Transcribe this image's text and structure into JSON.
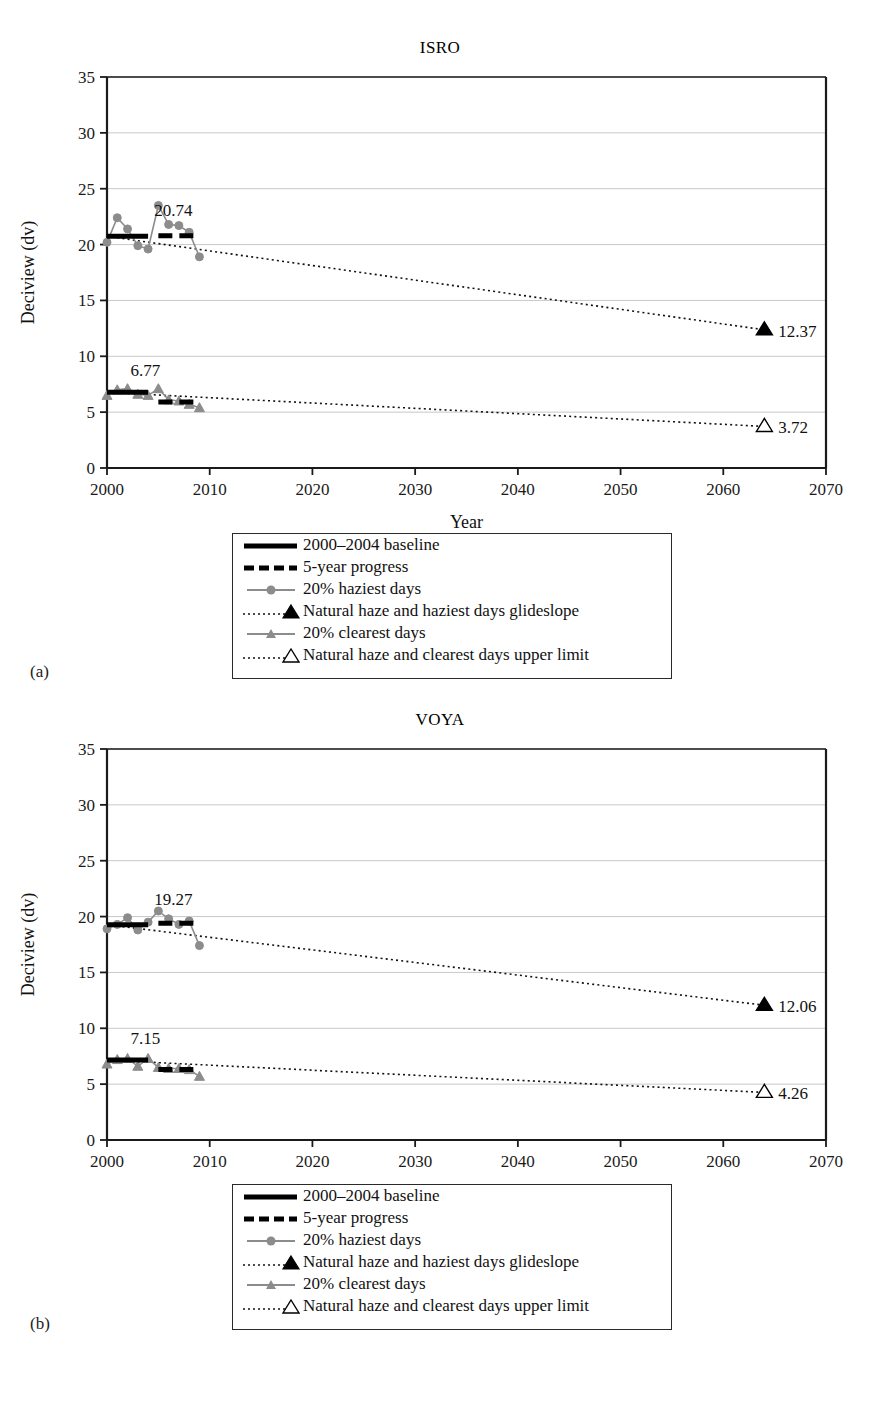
{
  "figure": {
    "panels": [
      {
        "sub_label": "(a)",
        "title": "ISRO",
        "xlabel": "Year",
        "ylabel": "Deciview (dv)",
        "baseline_haziest_label": "20.74",
        "baseline_clearest_label": "6.77",
        "endpoint_haziest_label": "12.37",
        "endpoint_clearest_label": "3.72"
      },
      {
        "sub_label": "(b)",
        "title": "VOYA",
        "xlabel": "Year",
        "ylabel": "Deciview (dv)",
        "baseline_haziest_label": "19.27",
        "baseline_clearest_label": "7.15",
        "endpoint_haziest_label": "12.06",
        "endpoint_clearest_label": "4.26"
      }
    ],
    "legend": {
      "items": [
        {
          "label": "2000–2004 baseline",
          "symbol": "solid-thick-black-line"
        },
        {
          "label": "5-year progress",
          "symbol": "dashed-thick-black-line"
        },
        {
          "label": "20% haziest days",
          "symbol": "gray-line-circle-marker"
        },
        {
          "label": "Natural haze and haziest days glideslope",
          "symbol": "dotted-line-filled-triangle"
        },
        {
          "label": "20% clearest days",
          "symbol": "gray-line-triangle-marker"
        },
        {
          "label": "Natural haze and clearest days upper limit",
          "symbol": "dotted-line-open-triangle"
        }
      ]
    },
    "colors": {
      "series_gray": "#8c8c8c",
      "baseline_black": "#000000",
      "axis_black": "#1a1a1a",
      "gridline_gray": "#c8c8c8",
      "background": "#ffffff"
    }
  },
  "chart_data": [
    {
      "type": "line",
      "title": "ISRO",
      "xlabel": "Year",
      "ylabel": "Deciview (dv)",
      "xlim": [
        2000,
        2070
      ],
      "ylim": [
        0,
        35
      ],
      "xticks": [
        2000,
        2010,
        2020,
        2030,
        2040,
        2050,
        2060,
        2070
      ],
      "yticks": [
        0,
        5,
        10,
        15,
        20,
        25,
        30,
        35
      ],
      "grid": true,
      "legend_position": "below-plot",
      "series": [
        {
          "name": "20% haziest days",
          "marker": "circle",
          "color": "#8c8c8c",
          "x": [
            2000,
            2001,
            2002,
            2003,
            2004,
            2005,
            2006,
            2007,
            2008,
            2009
          ],
          "values": [
            20.2,
            22.4,
            21.4,
            19.9,
            19.6,
            23.5,
            21.8,
            21.7,
            21.1,
            18.9
          ]
        },
        {
          "name": "20% clearest days",
          "marker": "triangle",
          "color": "#8c8c8c",
          "x": [
            2000,
            2001,
            2002,
            2003,
            2004,
            2005,
            2006,
            2007,
            2008,
            2009
          ],
          "values": [
            6.5,
            7.0,
            7.1,
            6.6,
            6.5,
            7.1,
            6.1,
            6.0,
            5.7,
            5.4
          ]
        },
        {
          "name": "2000–2004 baseline",
          "style": "solid-thick-black",
          "x": [
            2000,
            2004
          ],
          "value": 20.74
        },
        {
          "name": "2000–2004 baseline (clearest)",
          "style": "solid-thick-black",
          "x": [
            2000,
            2004
          ],
          "value": 6.77
        },
        {
          "name": "5-year progress (haziest)",
          "style": "dashed-thick-black",
          "x": [
            2005,
            2009
          ],
          "value": 20.8
        },
        {
          "name": "5-year progress (clearest)",
          "style": "dashed-thick-black",
          "x": [
            2005,
            2009
          ],
          "value": 5.9
        },
        {
          "name": "Natural haze and haziest days glideslope",
          "style": "dotted",
          "marker_end": "filled-triangle",
          "x": [
            2000,
            2064
          ],
          "values": [
            20.74,
            12.37
          ]
        },
        {
          "name": "Natural haze and clearest days upper limit",
          "style": "dotted",
          "marker_end": "open-triangle",
          "x": [
            2000,
            2064
          ],
          "values": [
            6.77,
            3.72
          ]
        }
      ]
    },
    {
      "type": "line",
      "title": "VOYA",
      "xlabel": "Year",
      "ylabel": "Deciview (dv)",
      "xlim": [
        2000,
        2070
      ],
      "ylim": [
        0,
        35
      ],
      "xticks": [
        2000,
        2010,
        2020,
        2030,
        2040,
        2050,
        2060,
        2070
      ],
      "yticks": [
        0,
        5,
        10,
        15,
        20,
        25,
        30,
        35
      ],
      "grid": true,
      "legend_position": "below-plot",
      "series": [
        {
          "name": "20% haziest days",
          "marker": "circle",
          "color": "#8c8c8c",
          "x": [
            2000,
            2001,
            2002,
            2003,
            2004,
            2005,
            2006,
            2007,
            2008,
            2009
          ],
          "values": [
            18.9,
            19.3,
            19.9,
            18.8,
            19.5,
            20.5,
            19.8,
            19.3,
            19.6,
            17.4
          ]
        },
        {
          "name": "20% clearest days",
          "marker": "triangle",
          "color": "#8c8c8c",
          "x": [
            2000,
            2001,
            2002,
            2003,
            2004,
            2005,
            2006,
            2007,
            2008,
            2009
          ],
          "values": [
            6.8,
            7.2,
            7.3,
            6.6,
            7.3,
            6.5,
            6.4,
            6.4,
            6.3,
            5.7
          ]
        },
        {
          "name": "2000–2004 baseline",
          "style": "solid-thick-black",
          "x": [
            2000,
            2004
          ],
          "value": 19.27
        },
        {
          "name": "2000–2004 baseline (clearest)",
          "style": "solid-thick-black",
          "x": [
            2000,
            2004
          ],
          "value": 7.15
        },
        {
          "name": "5-year progress (haziest)",
          "style": "dashed-thick-black",
          "x": [
            2005,
            2009
          ],
          "value": 19.4
        },
        {
          "name": "5-year progress (clearest)",
          "style": "dashed-thick-black",
          "x": [
            2005,
            2009
          ],
          "value": 6.3
        },
        {
          "name": "Natural haze and haziest days glideslope",
          "style": "dotted",
          "marker_end": "filled-triangle",
          "x": [
            2000,
            2064
          ],
          "values": [
            19.27,
            12.06
          ]
        },
        {
          "name": "Natural haze and clearest days upper limit",
          "style": "dotted",
          "marker_end": "open-triangle",
          "x": [
            2000,
            2064
          ],
          "values": [
            7.15,
            4.26
          ]
        }
      ]
    }
  ]
}
